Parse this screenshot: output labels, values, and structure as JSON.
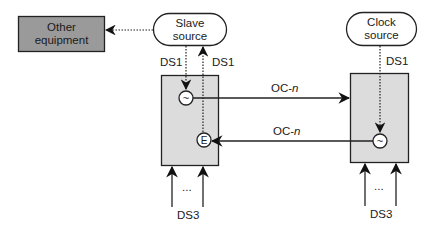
{
  "diagram": {
    "nodes": {
      "other_equipment": {
        "line1": "Other",
        "line2": "equipment",
        "fill": "#9a9a9a"
      },
      "slave_source": {
        "line1": "Slave",
        "line2": "source"
      },
      "clock_source": {
        "line1": "Clock",
        "line2": "source"
      },
      "left_ne": {
        "fill": "#dcdcdc"
      },
      "right_ne": {
        "fill": "#dcdcdc"
      },
      "left_clock_symbol": "~",
      "left_extract_symbol": "E",
      "right_clock_symbol": "~"
    },
    "labels": {
      "slave_ds1_down": "DS1",
      "slave_ds1_up": "DS1",
      "clock_ds1": "DS1",
      "oc_top_prefix": "OC-",
      "oc_top_suffix": "n",
      "oc_bottom_prefix": "OC-",
      "oc_bottom_suffix": "n",
      "left_ds3": "DS3",
      "right_ds3": "DS3",
      "left_ellipsis": "...",
      "right_ellipsis": "..."
    },
    "edges": [
      {
        "from": "slave_source",
        "to": "other_equipment",
        "style": "dotted"
      },
      {
        "from": "slave_source",
        "to": "left_clock_symbol",
        "style": "dotted",
        "label": "DS1"
      },
      {
        "from": "left_extract_symbol",
        "to": "slave_source",
        "style": "dotted",
        "label": "DS1"
      },
      {
        "from": "left_clock_symbol",
        "to": "right_ne",
        "style": "solid",
        "label": "OC-n"
      },
      {
        "from": "right_clock_symbol",
        "to": "left_extract_symbol",
        "style": "solid",
        "label": "OC-n"
      },
      {
        "from": "clock_source",
        "to": "right_clock_symbol",
        "style": "dotted",
        "label": "DS1"
      },
      {
        "from": "DS3",
        "to": "left_ne",
        "style": "solid",
        "count": 2
      },
      {
        "from": "DS3",
        "to": "right_ne",
        "style": "solid",
        "count": 2
      }
    ]
  }
}
